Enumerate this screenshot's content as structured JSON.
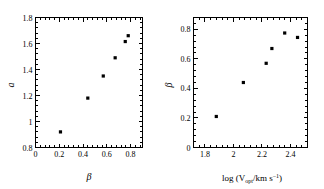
{
  "figure": {
    "background_color": "#ffffff",
    "foreground_color": "#000000",
    "panel_count": 2
  },
  "chart_data": [
    {
      "type": "scatter",
      "panel": "left",
      "title": "",
      "xlabel": "β",
      "ylabel": "a",
      "xlim": [
        0.0,
        0.9
      ],
      "ylim": [
        0.8,
        1.8
      ],
      "xticks": [
        0,
        0.2,
        0.4,
        0.6,
        0.8
      ],
      "xticklabels": [
        "0",
        "0.2",
        "0.4",
        "0.6",
        "0.8"
      ],
      "yticks": [
        0.8,
        1.0,
        1.2,
        1.4,
        1.6,
        1.8
      ],
      "yticklabels": [
        "0.8",
        "1",
        "1.2",
        "1.4",
        "1.6",
        "1.8"
      ],
      "minor_ticks": true,
      "ticks_inward": true,
      "grid": false,
      "legend": false,
      "marker": "square",
      "marker_color": "#000000",
      "x": [
        0.21,
        0.44,
        0.57,
        0.67,
        0.755,
        0.78
      ],
      "y": [
        0.92,
        1.18,
        1.35,
        1.49,
        1.615,
        1.66
      ]
    },
    {
      "type": "scatter",
      "panel": "right",
      "title": "",
      "xlabel": "log (V_opt/km s^-1)",
      "xlabel_parts": {
        "prefix": "log (V",
        "subscript": "opt",
        "middle": "/km s",
        "superscript": "−1",
        "suffix": ")"
      },
      "ylabel": "β",
      "xlim": [
        1.72,
        2.52
      ],
      "ylim": [
        0.0,
        0.88
      ],
      "xticks": [
        1.8,
        2.0,
        2.2,
        2.4
      ],
      "xticklabels": [
        "1.8",
        "2",
        "2.2",
        "2.4"
      ],
      "yticks": [
        0.0,
        0.2,
        0.4,
        0.6,
        0.8
      ],
      "yticklabels": [
        "0",
        "0.2",
        "0.4",
        "0.6",
        "0.8"
      ],
      "minor_ticks": true,
      "ticks_inward": true,
      "grid": false,
      "legend": false,
      "marker": "square",
      "marker_color": "#000000",
      "x": [
        1.88,
        2.07,
        2.23,
        2.27,
        2.36,
        2.45
      ],
      "y": [
        0.21,
        0.44,
        0.57,
        0.67,
        0.775,
        0.745
      ]
    }
  ]
}
